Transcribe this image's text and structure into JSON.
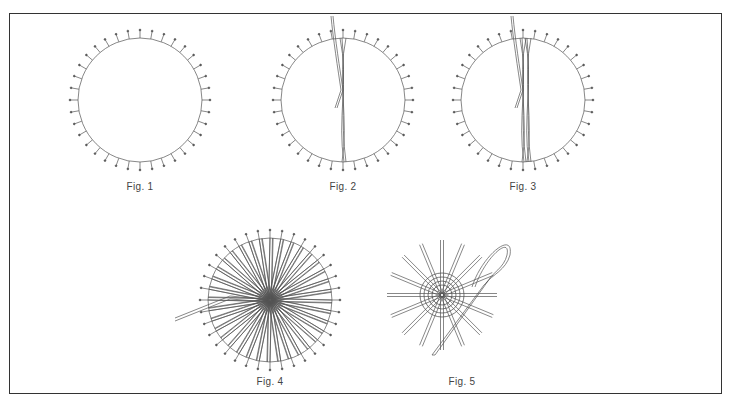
{
  "diagram": {
    "stroke_color": "#555555",
    "frame_color": "#333333",
    "figures": [
      {
        "id": "fig1",
        "caption": "Fig. 1",
        "cx": 140,
        "cy": 100,
        "r": 62,
        "pins": 36,
        "threads": 0
      },
      {
        "id": "fig2",
        "caption": "Fig. 2",
        "cx": 343,
        "cy": 100,
        "r": 62,
        "pins": 36,
        "threads": 1
      },
      {
        "id": "fig3",
        "caption": "Fig. 3",
        "cx": 523,
        "cy": 100,
        "r": 62,
        "pins": 36,
        "threads": 2
      },
      {
        "id": "fig4",
        "caption": "Fig. 4",
        "cx": 270,
        "cy": 300,
        "r": 62,
        "pins": 36,
        "threads": 36
      },
      {
        "id": "fig5",
        "caption": "Fig. 5",
        "cx": 452,
        "cy": 305,
        "r": 0,
        "pins": 0,
        "threads": 0
      }
    ]
  }
}
